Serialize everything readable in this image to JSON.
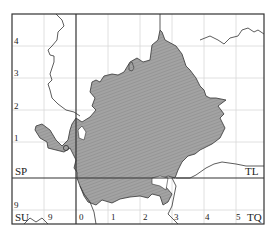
{
  "map": {
    "title": "",
    "grid_squares": {
      "upper_left": "SP",
      "upper_right": "TL",
      "lower_left": "SU",
      "lower_right": "TQ"
    },
    "northing_labels": [
      "4",
      "3",
      "2",
      "1"
    ],
    "lower_northing_label": "9",
    "easting_labels": [
      "0",
      "1",
      "2",
      "3",
      "4",
      "5"
    ],
    "lower_left_easting_label": "9",
    "colors": {
      "shaded_region": "#9a9a9a",
      "hatch": "#7f7f7f",
      "frame": "#333333",
      "grid": "#d8d8d8",
      "boundary": "#333333"
    },
    "features": {
      "shaded_area": "hatched county area",
      "marker": "small circle"
    }
  }
}
